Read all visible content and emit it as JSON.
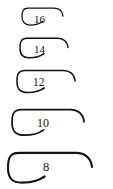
{
  "figure": {
    "background_color": "#ffffff",
    "ink_color": "#15110f",
    "orientation": "hook eye at right, bend and point at left",
    "item_count": 5
  },
  "chart_data": {
    "type": "table",
    "xlabel": "",
    "ylabel": "",
    "categories": [
      "16",
      "14",
      "12",
      "10",
      "8"
    ],
    "values": [
      44,
      53,
      64,
      78,
      92
    ],
    "series": [
      {
        "name": "relative hook length (px)",
        "values": [
          44,
          53,
          64,
          78,
          92
        ]
      }
    ],
    "annotations": [
      "Hooks shown actual size, largest number = smallest hook"
    ],
    "legend": [],
    "grid": false
  },
  "hooks": [
    {
      "size": "16",
      "label": "16",
      "row_top": 6,
      "shank_left": 22,
      "shank_right": 63,
      "height": 22,
      "label_left": 34,
      "label_top": 14,
      "font_size": 11,
      "stroke": 1.25
    },
    {
      "size": "14",
      "label": "14",
      "row_top": 36,
      "shank_left": 20,
      "shank_right": 68,
      "height": 25,
      "label_left": 34,
      "label_top": 44,
      "font_size": 11,
      "stroke": 1.4
    },
    {
      "size": "12",
      "label": "12",
      "row_top": 68,
      "shank_left": 17,
      "shank_right": 75,
      "height": 28,
      "label_left": 33,
      "label_top": 77,
      "font_size": 11.5,
      "stroke": 1.55
    },
    {
      "size": "10",
      "label": "10",
      "row_top": 107,
      "shank_left": 12,
      "shank_right": 84,
      "height": 32,
      "label_left": 37,
      "label_top": 117,
      "font_size": 12,
      "stroke": 1.75
    },
    {
      "size": "8",
      "label": "8",
      "row_top": 150,
      "shank_left": 8,
      "shank_right": 92,
      "height": 37,
      "label_left": 43,
      "label_top": 161,
      "font_size": 12.5,
      "stroke": 2.1
    }
  ]
}
